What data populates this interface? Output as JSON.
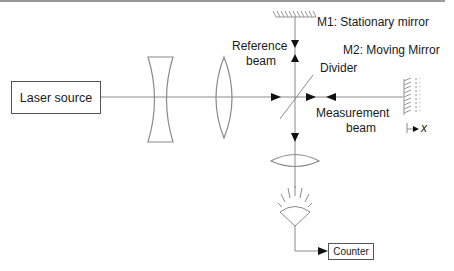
{
  "diagram": {
    "components": {
      "laser_source": "Laser source",
      "counter": "Counter"
    },
    "labels": {
      "m1": "M1: Stationary mirror",
      "m2": "M2: Moving Mirror",
      "reference_beam_line1": "Reference",
      "reference_beam_line2": "beam",
      "divider": "Divider",
      "measurement_beam_line1": "Measurement",
      "measurement_beam_line2": "beam",
      "axis_x": "x"
    },
    "colors": {
      "line": "#8a8a8a",
      "arrow": "#111111",
      "text": "#1a1a1a"
    }
  }
}
